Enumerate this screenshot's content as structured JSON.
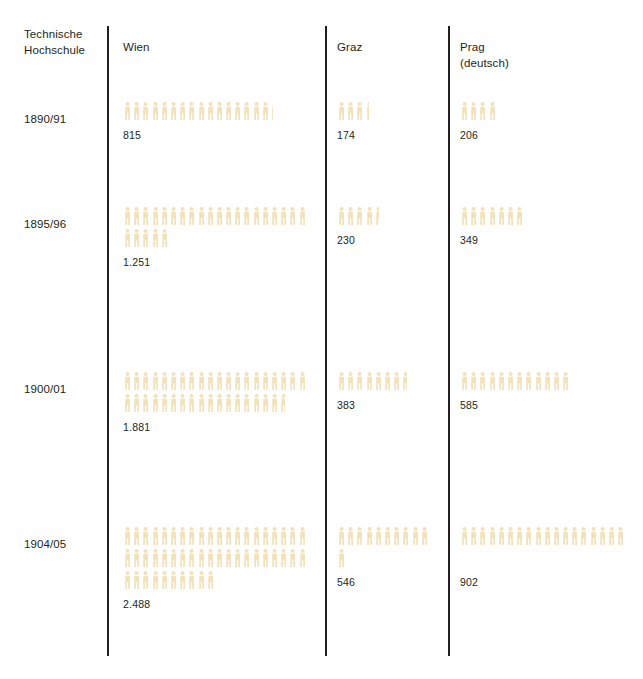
{
  "header": {
    "row_label_title": "Technische\nHochschule",
    "columns": [
      {
        "key": "wien",
        "label": "Wien"
      },
      {
        "key": "graz",
        "label": "Graz"
      },
      {
        "key": "prag",
        "label": "Prag\n(deutsch)"
      }
    ]
  },
  "colors": {
    "figure": "#F2E2BA",
    "text": "#231f20",
    "rule": "#231f20",
    "background": "#ffffff"
  },
  "icon": {
    "name": "person-pictogram",
    "unit_value": 50
  },
  "chart_data": {
    "type": "bar",
    "subtype": "isotype-pictogram",
    "title": "Technische Hochschule",
    "xlabel": "",
    "ylabel": "",
    "unit_per_symbol": 50,
    "symbol": "person-pictogram",
    "categories": [
      "1890/91",
      "1895/96",
      "1900/01",
      "1904/05"
    ],
    "series": [
      {
        "name": "Wien",
        "values": [
          815,
          1251,
          1881,
          2488
        ]
      },
      {
        "name": "Graz",
        "values": [
          174,
          230,
          383,
          546
        ]
      },
      {
        "name": "Prag (deutsch)",
        "values": [
          206,
          349,
          585,
          902
        ]
      }
    ],
    "value_labels": {
      "wien": [
        "815",
        "1.251",
        "1.881",
        "2.488"
      ],
      "graz": [
        "174",
        "230",
        "383",
        "546"
      ],
      "prag": [
        "206",
        "349",
        "585",
        "902"
      ]
    },
    "legend": [
      "Wien",
      "Graz",
      "Prag (deutsch)"
    ],
    "grid": false,
    "legend_position": "column-headers"
  },
  "rows": [
    {
      "label": "1890/91",
      "cells": {
        "wien": {
          "value": 815,
          "display": "815",
          "symbols": 16,
          "partial": 0.3
        },
        "graz": {
          "value": 174,
          "display": "174",
          "symbols": 3,
          "partial": 0.48
        },
        "prag": {
          "value": 206,
          "display": "206",
          "symbols": 4,
          "partial": 0.12
        }
      }
    },
    {
      "label": "1895/96",
      "cells": {
        "wien": {
          "value": 1251,
          "display": "1.251",
          "symbols": 25,
          "partial": 0.02
        },
        "graz": {
          "value": 230,
          "display": "230",
          "symbols": 4,
          "partial": 0.6
        },
        "prag": {
          "value": 349,
          "display": "349",
          "symbols": 6,
          "partial": 0.98
        }
      }
    },
    {
      "label": "1900/01",
      "cells": {
        "wien": {
          "value": 1881,
          "display": "1.881",
          "symbols": 37,
          "partial": 0.62
        },
        "graz": {
          "value": 383,
          "display": "383",
          "symbols": 7,
          "partial": 0.66
        },
        "prag": {
          "value": 585,
          "display": "585",
          "symbols": 11,
          "partial": 0.7
        }
      }
    },
    {
      "label": "1904/05",
      "cells": {
        "wien": {
          "value": 2488,
          "display": "2.488",
          "symbols": 49,
          "partial": 0.76
        },
        "graz": {
          "value": 546,
          "display": "546",
          "symbols": 10,
          "partial": 0.92
        },
        "prag": {
          "value": 902,
          "display": "902",
          "symbols": 18,
          "partial": 0.04
        }
      }
    }
  ],
  "layout": {
    "columns_per_line": {
      "wien": 20,
      "graz": 10,
      "prag": 18
    }
  }
}
